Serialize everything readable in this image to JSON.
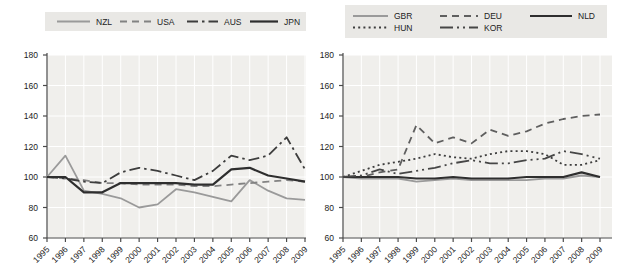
{
  "figure": {
    "background": "#ffffff",
    "plot_bg": "#f0efec",
    "grid_color": "#ffffff",
    "axis_color": "#4a4a4a",
    "legend_bg": "#e9e8e5",
    "text_color": "#222222"
  },
  "chart_data": [
    {
      "type": "line",
      "panel": "left",
      "title": "",
      "xlabel": "",
      "ylabel": "",
      "x": [
        1995,
        1996,
        1997,
        1998,
        1999,
        2000,
        2001,
        2002,
        2003,
        2004,
        2005,
        2006,
        2007,
        2008,
        2009
      ],
      "ylim": [
        60,
        180
      ],
      "yticks": [
        60,
        80,
        100,
        120,
        140,
        160,
        180
      ],
      "grid": true,
      "legend_position": "top",
      "series": [
        {
          "name": "NZL",
          "color": "#9a9a9a",
          "line_style": "solid",
          "width": 1.8,
          "values": [
            100,
            114,
            91,
            89,
            86,
            80,
            82,
            92,
            90,
            87,
            84,
            98,
            91,
            86,
            85
          ]
        },
        {
          "name": "USA",
          "color": "#828282",
          "line_style": "dashed",
          "width": 1.8,
          "values": [
            100,
            99,
            98,
            96,
            96,
            95,
            95,
            95,
            94,
            94,
            95,
            96,
            97,
            98,
            97
          ]
        },
        {
          "name": "AUS",
          "color": "#3d3d3d",
          "line_style": "dashdot",
          "width": 1.8,
          "values": [
            100,
            99,
            97,
            96,
            103,
            106,
            104,
            101,
            98,
            104,
            114,
            111,
            114,
            126,
            105
          ]
        },
        {
          "name": "JPN",
          "color": "#2e2e2e",
          "line_style": "solid",
          "width": 2.2,
          "values": [
            100,
            100,
            90,
            90,
            96,
            96,
            96,
            96,
            95,
            95,
            105,
            106,
            101,
            99,
            97
          ]
        }
      ]
    },
    {
      "type": "line",
      "panel": "right",
      "title": "",
      "xlabel": "",
      "ylabel": "",
      "x": [
        1995,
        1996,
        1997,
        1998,
        1999,
        2000,
        2001,
        2002,
        2003,
        2004,
        2005,
        2006,
        2007,
        2008,
        2009
      ],
      "ylim": [
        60,
        180
      ],
      "yticks": [
        60,
        80,
        100,
        120,
        140,
        160,
        180
      ],
      "grid": true,
      "legend_position": "top",
      "series": [
        {
          "name": "GBR",
          "color": "#9a9a9a",
          "line_style": "solid",
          "width": 1.8,
          "values": [
            100,
            99,
            99,
            99,
            97,
            98,
            99,
            98,
            98,
            98,
            98,
            99,
            99,
            101,
            100
          ]
        },
        {
          "name": "DEU",
          "color": "#5f5f5f",
          "line_style": "dashed",
          "width": 1.8,
          "values": [
            100,
            100,
            103,
            105,
            134,
            122,
            126,
            122,
            131,
            127,
            130,
            135,
            138,
            140,
            141
          ]
        },
        {
          "name": "NLD",
          "color": "#2e2e2e",
          "line_style": "solid",
          "width": 2.2,
          "values": [
            100,
            100,
            100,
            100,
            99,
            99,
            100,
            99,
            99,
            99,
            100,
            100,
            100,
            103,
            100
          ]
        },
        {
          "name": "HUN",
          "color": "#3d3d3d",
          "line_style": "dotted",
          "width": 1.8,
          "values": [
            100,
            104,
            108,
            110,
            112,
            115,
            113,
            112,
            115,
            117,
            117,
            115,
            108,
            108,
            111
          ]
        },
        {
          "name": "KOR",
          "color": "#464646",
          "line_style": "longdashdotdot",
          "width": 1.8,
          "values": [
            100,
            101,
            105,
            102,
            104,
            106,
            109,
            111,
            109,
            109,
            111,
            112,
            117,
            115,
            112
          ]
        }
      ]
    }
  ]
}
